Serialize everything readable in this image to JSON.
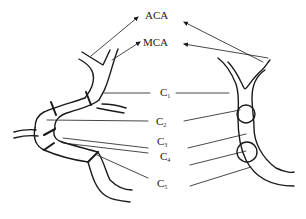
{
  "diagram": {
    "type": "anatomical-schematic",
    "colors": {
      "line": "#1a1a1a",
      "background": "#ffffff"
    },
    "labels": {
      "aca": "ACA",
      "mca": "MCA",
      "c1": {
        "base": "C",
        "sub": "1"
      },
      "c2": {
        "base": "C",
        "sub": "2"
      },
      "c3": {
        "base": "C",
        "sub": "3"
      },
      "c4": {
        "base": "C",
        "sub": "4"
      },
      "c5": {
        "base": "C",
        "sub": "5"
      }
    }
  }
}
